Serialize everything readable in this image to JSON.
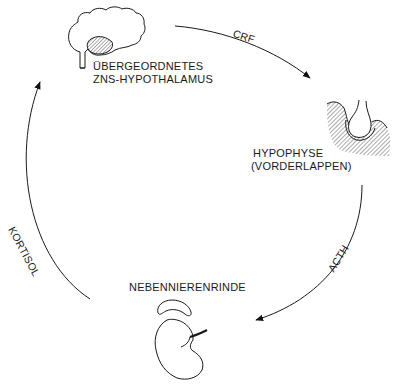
{
  "diagram": {
    "type": "feedback-cycle",
    "nodes": [
      {
        "id": "brain",
        "label_line1": "ÜBERGEORDNETES",
        "label_line2": "ZNS-HYPOTHALAMUS",
        "icon": "brain-icon"
      },
      {
        "id": "pituitary",
        "label_line1": "HYPOPHYSE",
        "label_line2": "(VORDERLAPPEN)",
        "icon": "pituitary-icon"
      },
      {
        "id": "adrenal",
        "label_line1": "NEBENNIERENRINDE",
        "icon": "adrenal-kidney-icon"
      }
    ],
    "edges": [
      {
        "from": "brain",
        "to": "pituitary",
        "label": "CRF"
      },
      {
        "from": "pituitary",
        "to": "adrenal",
        "label": "ACTH"
      },
      {
        "from": "adrenal",
        "to": "brain",
        "label": "KORTISOL"
      }
    ],
    "colors": {
      "line": "#1a1a1a",
      "background": "#ffffff",
      "hatch": "#555555"
    }
  }
}
